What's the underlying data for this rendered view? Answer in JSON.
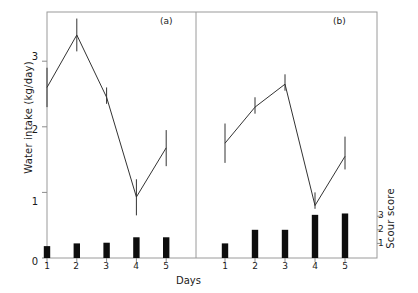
{
  "figure": {
    "xlabel": "Days",
    "ylabel_left": "Water intake (kg/day)",
    "ylabel_right": "Scour score",
    "panel_a_tag": "(a)",
    "panel_b_tag": "(b)",
    "line_color": "#333333",
    "bar_color": "#0d0d0d",
    "axis_color": "#8c8c8c",
    "frame_color": "#9a9a9a"
  },
  "axes": {
    "y_left_ticks": [
      "0",
      "1",
      "2",
      "3"
    ],
    "y_left_values": [
      0,
      1,
      2,
      3
    ],
    "y_left_range": [
      0,
      3.75
    ],
    "y_right_ticks": [
      "1",
      "2",
      "3"
    ],
    "y_right_values": [
      1,
      2,
      3
    ],
    "x_ticks": [
      "1",
      "2",
      "3",
      "4",
      "5"
    ],
    "x_values": [
      1,
      2,
      3,
      4,
      5
    ]
  },
  "chart_data": [
    {
      "type": "line",
      "title": "(a)",
      "xlabel": "Days",
      "ylabel": "Water intake (kg/day)",
      "x": [
        1,
        2,
        3,
        4,
        5
      ],
      "ylim": [
        0,
        3.75
      ],
      "grid": false,
      "legend": "none",
      "series": [
        {
          "name": "Water intake",
          "values": [
            2.6,
            3.4,
            2.45,
            0.93,
            1.68
          ],
          "error_low": [
            2.3,
            3.15,
            2.35,
            0.65,
            1.4
          ],
          "error_high": [
            2.9,
            3.65,
            2.6,
            1.2,
            1.95
          ],
          "marker": "none",
          "style": "line-with-error-bars"
        },
        {
          "name": "Scour score",
          "values": [
            0.8,
            1.0,
            1.05,
            1.45,
            1.45
          ],
          "axis": "right",
          "style": "bar"
        }
      ]
    },
    {
      "type": "line",
      "title": "(b)",
      "xlabel": "Days",
      "ylabel": "Water intake (kg/day)",
      "x": [
        1,
        2,
        3,
        4,
        5
      ],
      "ylim": [
        0,
        3.75
      ],
      "grid": false,
      "legend": "none",
      "series": [
        {
          "name": "Water intake",
          "values": [
            1.75,
            2.3,
            2.65,
            0.8,
            1.55
          ],
          "error_low": [
            1.45,
            2.2,
            2.55,
            0.75,
            1.35
          ],
          "error_high": [
            2.05,
            2.45,
            2.8,
            1.0,
            1.85
          ],
          "marker": "none",
          "style": "line-with-error-bars"
        },
        {
          "name": "Scour score",
          "values": [
            1.0,
            2.0,
            2.0,
            3.1,
            3.2
          ],
          "axis": "right",
          "style": "bar"
        }
      ]
    }
  ]
}
